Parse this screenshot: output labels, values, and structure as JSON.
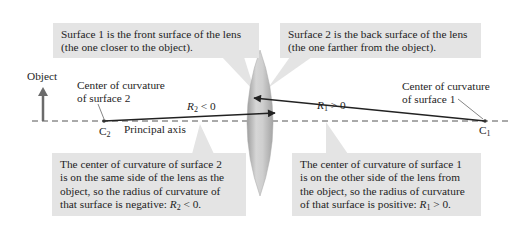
{
  "callouts": {
    "surface1": {
      "line1": "Surface 1 is the front surface of the lens",
      "line2": "(the one closer to the object)."
    },
    "surface2": {
      "line1": "Surface 2 is the back surface of the lens",
      "line2": "(the one farther from the object)."
    },
    "center2": {
      "line1": "The center of curvature of surface 2",
      "line2": "is on the same side of the lens as the",
      "line3": "object, so the radius of curvature of",
      "line4_prefix": "that surface is negative: ",
      "symbol": "R",
      "subscript": "2",
      "relation": " < 0."
    },
    "center1": {
      "line1": "The center of curvature of surface 1",
      "line2": "is on the other side of the lens from",
      "line3": "the object, so the radius of curvature",
      "line4_prefix": "of that surface is positive: ",
      "symbol": "R",
      "subscript": "1",
      "relation": " > 0."
    }
  },
  "labels": {
    "object": "Object",
    "center2": {
      "line1": "Center of curvature",
      "line2": "of surface 2"
    },
    "center1": {
      "line1": "Center of curvature",
      "line2": "of surface 1"
    },
    "principal_axis": "Principal axis",
    "c2": {
      "symbol": "C",
      "subscript": "2"
    },
    "c1": {
      "symbol": "C",
      "subscript": "1"
    },
    "r2": {
      "symbol": "R",
      "subscript": "2",
      "relation": " < 0"
    },
    "r1": {
      "symbol": "R",
      "subscript": "1",
      "relation": " > 0"
    }
  },
  "colors": {
    "callout_bg": "#e4e4e4",
    "axis": "#555555",
    "arrow": "#222222",
    "object_arrow": "#6b6b6b",
    "lens_fill": "#c4c4c4"
  }
}
